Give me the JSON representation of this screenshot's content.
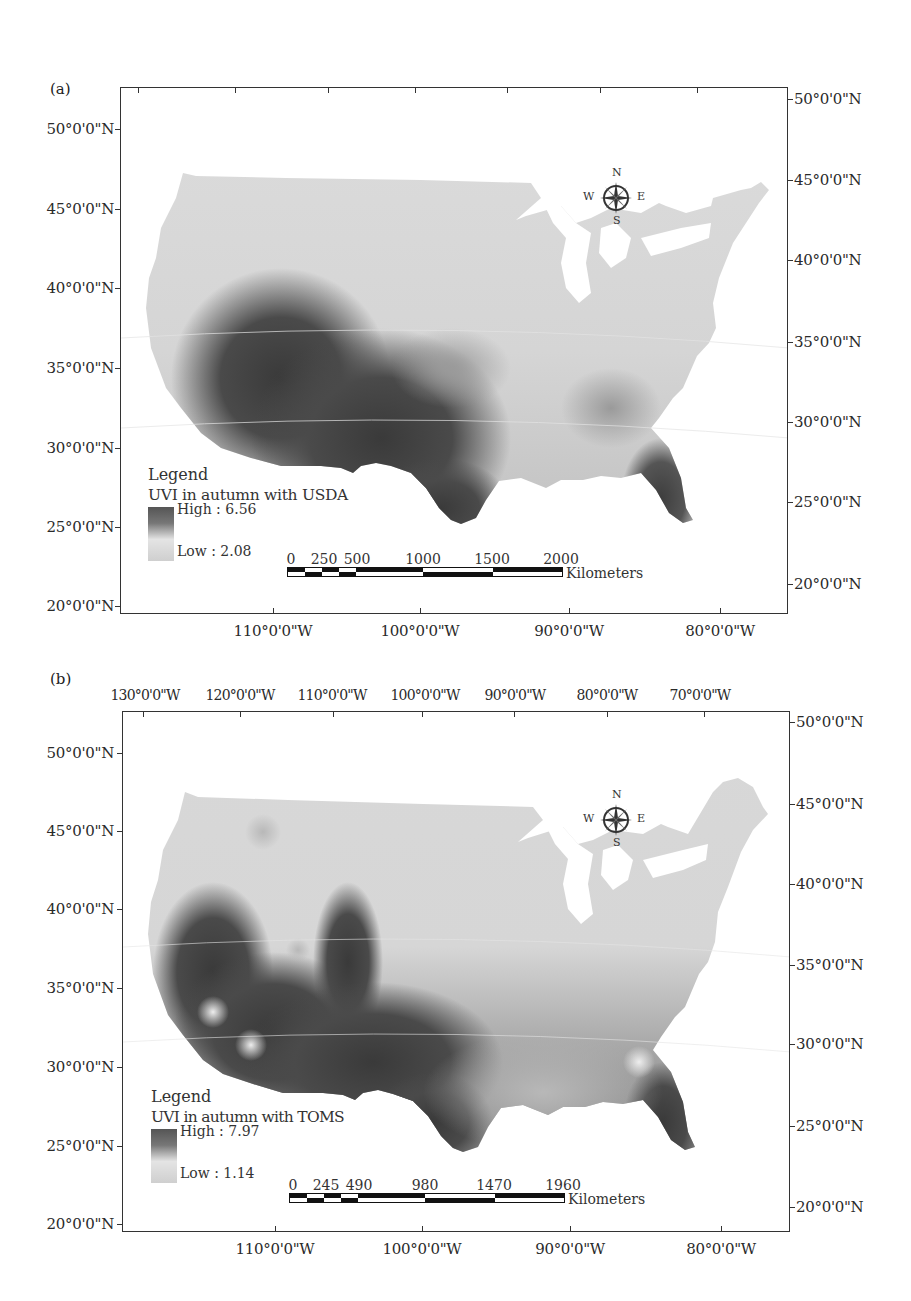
{
  "figure": {
    "panels": [
      {
        "id": "a",
        "label": "(a)",
        "top_axis": [
          "130°0'0\"W",
          "120°0'0\"W",
          "110°0'0\"W",
          "100°0'0\"W",
          "90°0'0\"W",
          "80°0'0\"W",
          "70°0'0\"W"
        ],
        "bottom_axis": [
          "110°0'0\"W",
          "100°0'0\"W",
          "90°0'0\"W",
          "80°0'0\"W"
        ],
        "left_axis": [
          "50°0'0\"N",
          "45°0'0\"N",
          "40°0'0\"N",
          "35°0'0\"N",
          "30°0'0\"N",
          "25°0'0\"N",
          "20°0'0\"N"
        ],
        "right_axis": [
          "50°0'0\"N",
          "45°0'0\"N",
          "40°0'0\"N",
          "35°0'0\"N",
          "30°0'0\"N",
          "25°0'0\"N",
          "20°0'0\"N"
        ],
        "legend": {
          "title": "Legend",
          "subtitle": "UVI in autumn with USDA",
          "high_label": "High : 6.56",
          "low_label": "Low : 2.08"
        },
        "scalebar": {
          "ticks": [
            "0",
            "250",
            "500",
            "1000",
            "1500",
            "2000"
          ],
          "unit": "Kilometers"
        },
        "compass": {
          "n": "N",
          "s": "S",
          "e": "E",
          "w": "W"
        }
      },
      {
        "id": "b",
        "label": "(b)",
        "top_axis": [
          "130°0'0\"W",
          "120°0'0\"W",
          "110°0'0\"W",
          "100°0'0\"W",
          "90°0'0\"W",
          "80°0'0\"W",
          "70°0'0\"W"
        ],
        "bottom_axis": [
          "110°0'0\"W",
          "100°0'0\"W",
          "90°0'0\"W",
          "80°0'0\"W"
        ],
        "left_axis": [
          "50°0'0\"N",
          "45°0'0\"N",
          "40°0'0\"N",
          "35°0'0\"N",
          "30°0'0\"N",
          "25°0'0\"N",
          "20°0'0\"N"
        ],
        "right_axis": [
          "50°0'0\"N",
          "45°0'0\"N",
          "40°0'0\"N",
          "35°0'0\"N",
          "30°0'0\"N",
          "25°0'0\"N",
          "20°0'0\"N"
        ],
        "legend": {
          "title": "Legend",
          "subtitle": "UVI in autumn with TOMS",
          "high_label": "High : 7.97",
          "low_label": "Low : 1.14"
        },
        "scalebar": {
          "ticks": [
            "0",
            "245",
            "490",
            "980",
            "1470",
            "1960"
          ],
          "unit": "Kilometers"
        },
        "compass": {
          "n": "N",
          "s": "S",
          "e": "E",
          "w": "W"
        }
      }
    ]
  },
  "colors": {
    "high": "#3c3c3c",
    "low": "#d9d9d9",
    "frame": "#333333"
  }
}
